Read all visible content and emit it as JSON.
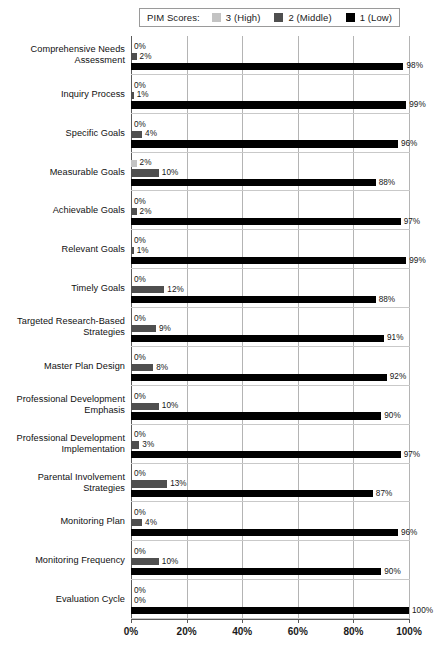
{
  "legend": {
    "title": "PIM Scores:",
    "entries": [
      {
        "label": "3 (High)",
        "color": "#c3c3c3",
        "swatch_name": "legend-swatch-high"
      },
      {
        "label": "2 (Middle)",
        "color": "#4f4f4f",
        "swatch_name": "legend-swatch-middle"
      },
      {
        "label": "1 (Low)",
        "color": "#000000",
        "swatch_name": "legend-swatch-low"
      }
    ]
  },
  "axis": {
    "x_ticks": [
      "0%",
      "20%",
      "40%",
      "60%",
      "80%",
      "100%"
    ],
    "x_min": 0,
    "x_max": 100,
    "gridlines": [
      20,
      40,
      60,
      80,
      100
    ]
  },
  "chart_data": {
    "type": "bar",
    "title": "",
    "subtitle": "",
    "xlabel": "",
    "ylabel": "",
    "xlim": [
      0,
      100
    ],
    "grid": true,
    "orientation": "horizontal",
    "legend_position": "top",
    "legend_title": "PIM Scores:",
    "categories": [
      "Comprehensive Needs Assessment",
      "Inquiry Process",
      "Specific Goals",
      "Measurable Goals",
      "Achievable Goals",
      "Relevant Goals",
      "Timely Goals",
      "Targeted Research-Based Strategies",
      "Master Plan Design",
      "Professional Development Emphasis",
      "Professional Development Implementation",
      "Parental Involvement Strategies",
      "Monitoring Plan",
      "Monitoring Frequency",
      "Evaluation Cycle"
    ],
    "series": [
      {
        "name": "3 (High)",
        "color": "#c3c3c3",
        "values": [
          0,
          0,
          0,
          2,
          0,
          0,
          0,
          0,
          0,
          0,
          0,
          0,
          0,
          0,
          0
        ]
      },
      {
        "name": "2 (Middle)",
        "color": "#4f4f4f",
        "values": [
          2,
          1,
          4,
          10,
          2,
          1,
          12,
          9,
          8,
          10,
          3,
          13,
          4,
          10,
          0
        ]
      },
      {
        "name": "1 (Low)",
        "color": "#000000",
        "values": [
          98,
          99,
          96,
          88,
          97,
          99,
          88,
          91,
          92,
          90,
          97,
          87,
          96,
          90,
          100
        ]
      }
    ],
    "data_labels": [
      {
        "category": "Comprehensive Needs Assessment",
        "high": "0%",
        "middle": "2%",
        "low": "98%"
      },
      {
        "category": "Inquiry Process",
        "high": "0%",
        "middle": "1%",
        "low": "99%"
      },
      {
        "category": "Specific Goals",
        "high": "0%",
        "middle": "4%",
        "low": "96%"
      },
      {
        "category": "Measurable Goals",
        "high": "2%",
        "middle": "10%",
        "low": "88%"
      },
      {
        "category": "Achievable Goals",
        "high": "0%",
        "middle": "2%",
        "low": "97%"
      },
      {
        "category": "Relevant Goals",
        "high": "0%",
        "middle": "1%",
        "low": "99%"
      },
      {
        "category": "Timely Goals",
        "high": "0%",
        "middle": "12%",
        "low": "88%"
      },
      {
        "category": "Targeted Research-Based Strategies",
        "high": "0%",
        "middle": "9%",
        "low": "91%"
      },
      {
        "category": "Master Plan Design",
        "high": "0%",
        "middle": "8%",
        "low": "92%"
      },
      {
        "category": "Professional Development Emphasis",
        "high": "0%",
        "middle": "10%",
        "low": "90%"
      },
      {
        "category": "Professional Development Implementation",
        "high": "0%",
        "middle": "3%",
        "low": "97%"
      },
      {
        "category": "Parental Involvement Strategies",
        "high": "0%",
        "middle": "13%",
        "low": "87%"
      },
      {
        "category": "Monitoring Plan",
        "high": "0%",
        "middle": "4%",
        "low": "96%"
      },
      {
        "category": "Monitoring Frequency",
        "high": "0%",
        "middle": "10%",
        "low": "90%"
      },
      {
        "category": "Evaluation Cycle",
        "high": "0%",
        "middle": "0%",
        "low": "100%"
      }
    ],
    "category_label_lines": [
      [
        "Comprehensive Needs",
        "Assessment"
      ],
      [
        "Inquiry Process"
      ],
      [
        "Specific Goals"
      ],
      [
        "Measurable Goals"
      ],
      [
        "Achievable Goals"
      ],
      [
        "Relevant Goals"
      ],
      [
        "Timely Goals"
      ],
      [
        "Targeted Research-Based",
        "Strategies"
      ],
      [
        "Master Plan Design"
      ],
      [
        "Professional Development",
        "Emphasis"
      ],
      [
        "Professional Development",
        "Implementation"
      ],
      [
        "Parental Involvement",
        "Strategies"
      ],
      [
        "Monitoring Plan"
      ],
      [
        "Monitoring Frequency"
      ],
      [
        "Evaluation Cycle"
      ]
    ]
  }
}
